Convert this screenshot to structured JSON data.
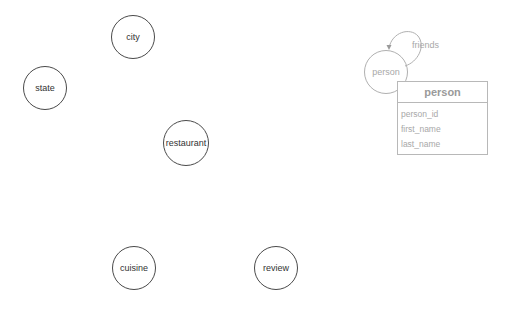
{
  "diagram": {
    "nodes": [
      {
        "id": "city",
        "label": "city",
        "cx": 133,
        "cy": 37,
        "r": 22
      },
      {
        "id": "state",
        "label": "state",
        "cx": 45,
        "cy": 88,
        "r": 22
      },
      {
        "id": "restaurant",
        "label": "restaurant",
        "cx": 186,
        "cy": 143,
        "r": 23
      },
      {
        "id": "cuisine",
        "label": "cuisine",
        "cx": 134,
        "cy": 268,
        "r": 22
      },
      {
        "id": "review",
        "label": "review",
        "cx": 276,
        "cy": 268,
        "r": 22
      }
    ],
    "selected_node": {
      "id": "person",
      "label": "person",
      "cx": 386,
      "cy": 72,
      "r": 22
    },
    "self_edge": {
      "label": "friends",
      "from": "person",
      "to": "person"
    },
    "table": {
      "title": "person",
      "fields": [
        "person_id",
        "first_name",
        "last_name"
      ]
    },
    "colors": {
      "node_stroke": "#4a4a4a",
      "faded_stroke": "#b0b0b0",
      "faded_text": "#a8a8a8"
    }
  }
}
